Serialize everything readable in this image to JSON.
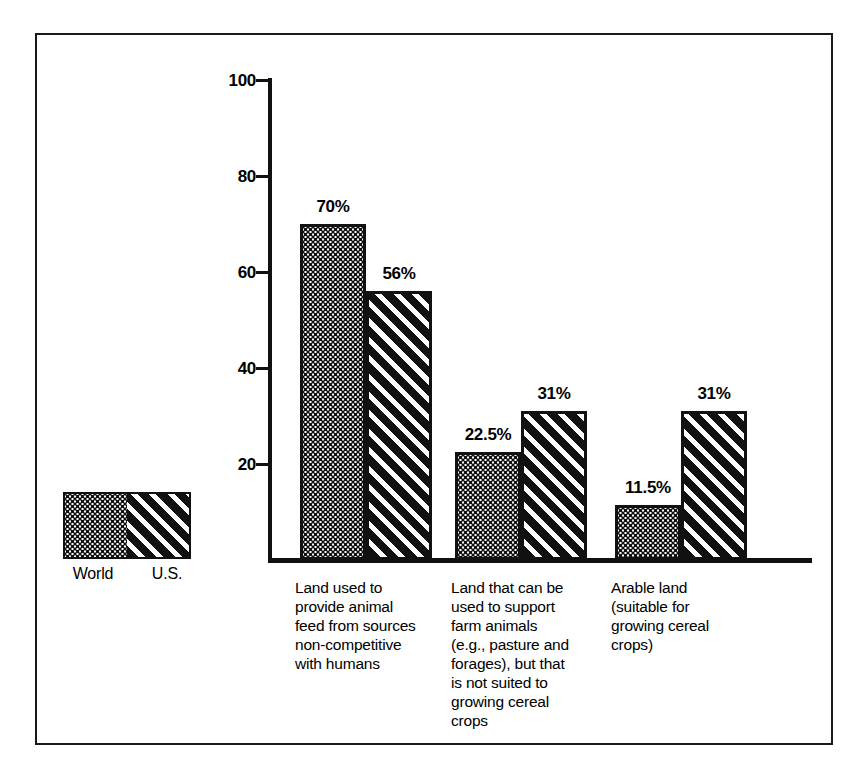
{
  "chart_data": {
    "type": "bar",
    "title": "",
    "subtitle": "",
    "xlabel": "",
    "ylabel": "",
    "ylim": [
      0,
      100
    ],
    "yticks": [
      0,
      20,
      40,
      60,
      80,
      100
    ],
    "ytick_labels": [
      "20",
      "40",
      "60",
      "80",
      "100"
    ],
    "grid": false,
    "legend_position": "bottom-left",
    "categories": [
      "Land used to\nprovide animal\nfeed from sources\nnon-competitive\nwith humans",
      "Land that can be\nused to support\nfarm animals\n(e.g., pasture and\nforages), but that\nis not suited to\ngrowing cereal\ncrops",
      "Arable land\n(suitable for\ngrowing cereal\ncrops)"
    ],
    "series": [
      {
        "name": "World",
        "pattern": "dotted",
        "values": [
          70,
          22.5,
          11.5
        ],
        "labels": [
          "70%",
          "22.5%",
          "11.5%"
        ]
      },
      {
        "name": "U.S.",
        "pattern": "diagonal-stripes",
        "values": [
          56,
          31,
          31
        ],
        "labels": [
          "56%",
          "31%",
          "31%"
        ]
      }
    ]
  },
  "legend": {
    "entries": [
      {
        "label": "World",
        "pattern": "dotted"
      },
      {
        "label": "U.S.",
        "pattern": "diagonal-stripes"
      }
    ]
  },
  "colors": {
    "ink": "#111111",
    "paper": "#ffffff"
  }
}
